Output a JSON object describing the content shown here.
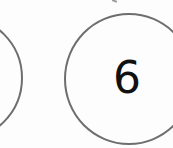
{
  "diagram": {
    "type": "number-bond",
    "circles": [
      {
        "id": "left",
        "label": ""
      },
      {
        "id": "right",
        "label": "6"
      }
    ],
    "colors": {
      "stroke": "#6e6e6e",
      "text": "#111111",
      "background": "#fdfdfd"
    }
  }
}
